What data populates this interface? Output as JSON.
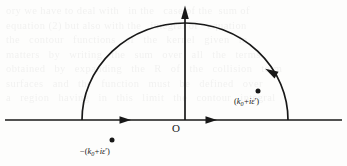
{
  "figure": {
    "type": "complex-contour-diagram",
    "background_color": "#fdfdfc",
    "ink_color": "#181818",
    "ghost_text": "ory we have to deal with   in the   case of the  sum of\nequation (2) but also with the   integral of   equation\nthe   contour   functions   of   the   kernel   given   in\nmatters   by   writing   the   sum   over   all   the   terms\nobtained   by   expanding   the   R   of   the   collision   term\nsurfaces   and   the   function   must   be   defined   over\na   region   having   in   this   limit   the   contour   integral"
  },
  "axes": {
    "real_axis": {
      "label_name": "real-axis",
      "y": 120,
      "x_start": 5,
      "x_end": 342,
      "arrow_positions": [
        127,
        213
      ],
      "arrow_direction": "right"
    },
    "imaginary_axis": {
      "label_name": "imaginary-axis",
      "x": 185,
      "y_bottom": 120,
      "y_top": 8,
      "arrow_direction": "up"
    },
    "origin": {
      "label": "O",
      "x": 185,
      "y": 120
    }
  },
  "contour": {
    "shape": "semicircle",
    "center_x": 185,
    "center_y": 120,
    "radius_x": 103,
    "radius_y": 97,
    "left_foot_x": 82,
    "right_foot_x": 288,
    "apex_y": 23,
    "orientation": "counterclockwise",
    "arrow_angle_deg": 33,
    "arrow_point": {
      "x": 271,
      "y": 72
    }
  },
  "poles": [
    {
      "name": "pole-positive",
      "dot": {
        "x": 258,
        "y": 91
      },
      "label_parts": {
        "open": "(",
        "k": "k",
        "subscript": "0",
        "plus": "+i",
        "epsilon": "ε",
        "prime": "′",
        "close": ")"
      },
      "label_text": "(k₀+iε′)"
    },
    {
      "name": "pole-negative",
      "dot": {
        "x": 112,
        "y": 140
      },
      "label_parts": {
        "minus": "−",
        "open": "(",
        "k": "k",
        "subscript": "0",
        "plus": "+i",
        "epsilon": "ε",
        "prime": "′",
        "close": ")"
      },
      "label_text": "−(k₀+iε′)"
    }
  ]
}
